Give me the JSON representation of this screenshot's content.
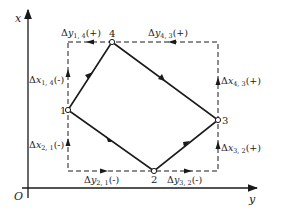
{
  "diagram": {
    "axes": {
      "x_label": "x",
      "y_label": "y",
      "origin_label": "O"
    },
    "points": [
      {
        "id": "1",
        "label": "1",
        "x": 68,
        "y": 110
      },
      {
        "id": "2",
        "label": "2",
        "x": 154,
        "y": 171
      },
      {
        "id": "3",
        "label": "3",
        "x": 218,
        "y": 120
      },
      {
        "id": "4",
        "label": "4",
        "x": 112,
        "y": 42
      }
    ],
    "increments": {
      "dy14": {
        "delta": "Δ",
        "var": "y",
        "sub": "1, 4",
        "sign": "(+)"
      },
      "dy43": {
        "delta": "Δ",
        "var": "y",
        "sub": "4, 3",
        "sign": "(+)"
      },
      "dx14": {
        "delta": "Δ",
        "var": "x",
        "sub": "1, 4",
        "sign": "(-)"
      },
      "dx21": {
        "delta": "Δ",
        "var": "x",
        "sub": "2, 1",
        "sign": "(-)"
      },
      "dx43": {
        "delta": "Δ",
        "var": "x",
        "sub": "4, 3",
        "sign": "(+)"
      },
      "dx32": {
        "delta": "Δ",
        "var": "x",
        "sub": "3, 2",
        "sign": "(+)"
      },
      "dy21": {
        "delta": "Δ",
        "var": "y",
        "sub": "2, 1",
        "sign": "(-)"
      },
      "dy32": {
        "delta": "Δ",
        "var": "y",
        "sub": "3, 2",
        "sign": "(-)"
      }
    },
    "colors": {
      "line": "#1a1a1a",
      "background": "#ffffff"
    }
  }
}
